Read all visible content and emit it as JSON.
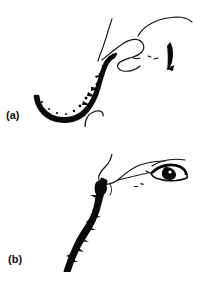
{
  "figure": {
    "background_color": "#ffffff",
    "ink_color": "#000000",
    "frame_color": "#2b2b2b",
    "panel_count": 2,
    "panels": [
      {
        "id": "a",
        "label": "(a)",
        "label_position": "left-bottom-outside",
        "frame": {
          "x": 26,
          "y": 14,
          "width": 167,
          "height": 113
        },
        "description": "Line drawing of a face in profile with a thick ragged black contour running from lower-left jaw up to the lips and nose; thin outlines for nose, lips and a partial eye at upper right.",
        "strokes": [
          {
            "name": "thick-jaw-chin-contour",
            "style": "thick-ragged-black"
          },
          {
            "name": "thin-forehead-nose-ridge-line",
            "style": "thin-black"
          },
          {
            "name": "thin-nose-lip-outline",
            "style": "thin-black"
          },
          {
            "name": "thin-chin-hook",
            "style": "thin-black"
          },
          {
            "name": "partial-eye-mark",
            "style": "thick-black-blob"
          },
          {
            "name": "brow-arc",
            "style": "thin-black"
          }
        ]
      },
      {
        "id": "b",
        "label": "(b)",
        "label_position": "left-bottom-outside",
        "frame": {
          "x": 30,
          "y": 154,
          "width": 160,
          "height": 118
        },
        "description": "Line drawing of the same face at a different angle; a thick sinuous black contour descends from the nose bridge down through the chin to the lower frame edge, with a detailed eye drawn at upper right.",
        "strokes": [
          {
            "name": "thick-profile-contour",
            "style": "thick-ragged-black"
          },
          {
            "name": "thin-nose-outline",
            "style": "thin-black"
          },
          {
            "name": "thin-cheek-line",
            "style": "thin-black"
          },
          {
            "name": "eye-outline",
            "style": "thin-black"
          },
          {
            "name": "eye-iris",
            "style": "filled-black"
          },
          {
            "name": "eyebrow-arc",
            "style": "thin-black"
          }
        ]
      }
    ]
  }
}
